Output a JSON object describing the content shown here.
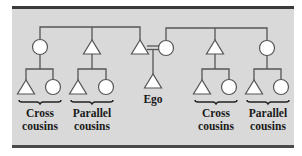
{
  "diagram": {
    "colors": {
      "panel": "#d9d9d9",
      "line": "#555555",
      "symbol_fill": "#ffffff",
      "text": "#1a1a1a",
      "border": "#3a3a3a"
    },
    "legend_symbols": {
      "triangle": "male",
      "circle": "female",
      "equals": "marriage"
    },
    "ego_label": "Ego",
    "groups": [
      {
        "id": "left-cross",
        "line1": "Cross",
        "line2": "cousins"
      },
      {
        "id": "left-parallel",
        "line1": "Parallel",
        "line2": "cousins"
      },
      {
        "id": "right-cross",
        "line1": "Cross",
        "line2": "cousins"
      },
      {
        "id": "right-parallel",
        "line1": "Parallel",
        "line2": "cousins"
      }
    ],
    "nodes": [
      {
        "id": "fa-sister",
        "shape": "circle",
        "role": "father's sister"
      },
      {
        "id": "fa-brother",
        "shape": "triangle",
        "role": "father's brother"
      },
      {
        "id": "father",
        "shape": "triangle",
        "role": "father"
      },
      {
        "id": "mother",
        "shape": "circle",
        "role": "mother"
      },
      {
        "id": "mo-brother",
        "shape": "triangle",
        "role": "mother's brother"
      },
      {
        "id": "mo-sister",
        "shape": "circle",
        "role": "mother's sister"
      },
      {
        "id": "ego",
        "shape": "triangle",
        "role": "Ego"
      }
    ]
  }
}
